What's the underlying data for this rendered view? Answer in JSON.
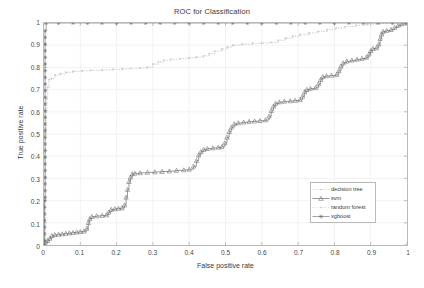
{
  "chart_data": {
    "type": "line",
    "title": "ROC for Classification",
    "xlabel": "False positive rate",
    "ylabel": "True positive rate",
    "xlim": [
      0,
      1
    ],
    "ylim": [
      0,
      1
    ],
    "xticks": [
      "0",
      "0.1",
      "0.2",
      "0.3",
      "0.4",
      "0.5",
      "0.6",
      "0.7",
      "0.8",
      "0.9",
      "1"
    ],
    "yticks": [
      "0",
      "0.1",
      "0.2",
      "0.3",
      "0.4",
      "0.5",
      "0.6",
      "0.7",
      "0.8",
      "0.9",
      "1"
    ],
    "grid": true,
    "legend_position": "lower-right",
    "series": [
      {
        "name": "decision tree",
        "color": "#c8c8c8",
        "marker": "dot",
        "linestyle": "dotted",
        "points": [
          [
            0,
            0
          ],
          [
            0.004,
            0.52
          ],
          [
            0.006,
            0.6
          ],
          [
            0.008,
            0.66
          ],
          [
            0.01,
            0.71
          ],
          [
            0.014,
            0.745
          ],
          [
            0.02,
            0.75
          ],
          [
            0.03,
            0.765
          ],
          [
            0.045,
            0.772
          ],
          [
            0.06,
            0.778
          ],
          [
            0.08,
            0.782
          ],
          [
            0.105,
            0.785
          ],
          [
            0.13,
            0.787
          ],
          [
            0.16,
            0.789
          ],
          [
            0.19,
            0.791
          ],
          [
            0.215,
            0.793
          ],
          [
            0.24,
            0.795
          ],
          [
            0.265,
            0.797
          ],
          [
            0.285,
            0.8
          ],
          [
            0.3,
            0.815
          ],
          [
            0.315,
            0.825
          ],
          [
            0.33,
            0.832
          ],
          [
            0.35,
            0.836
          ],
          [
            0.375,
            0.84
          ],
          [
            0.4,
            0.843
          ],
          [
            0.42,
            0.846
          ],
          [
            0.44,
            0.852
          ],
          [
            0.455,
            0.862
          ],
          [
            0.47,
            0.872
          ],
          [
            0.49,
            0.882
          ],
          [
            0.505,
            0.892
          ],
          [
            0.52,
            0.9
          ],
          [
            0.545,
            0.905
          ],
          [
            0.575,
            0.908
          ],
          [
            0.6,
            0.91
          ],
          [
            0.625,
            0.913
          ],
          [
            0.645,
            0.922
          ],
          [
            0.665,
            0.932
          ],
          [
            0.685,
            0.94
          ],
          [
            0.705,
            0.948
          ],
          [
            0.73,
            0.955
          ],
          [
            0.755,
            0.962
          ],
          [
            0.78,
            0.97
          ],
          [
            0.805,
            0.977
          ],
          [
            0.83,
            0.984
          ],
          [
            0.86,
            0.99
          ],
          [
            0.89,
            0.995
          ],
          [
            0.925,
            0.998
          ],
          [
            0.96,
            1.0
          ],
          [
            1,
            1
          ]
        ]
      },
      {
        "name": "svm",
        "color": "#666666",
        "marker": "triangle",
        "linestyle": "solid",
        "points": [
          [
            0,
            0
          ],
          [
            0.004,
            0.012
          ],
          [
            0.01,
            0.02
          ],
          [
            0.016,
            0.03
          ],
          [
            0.022,
            0.042
          ],
          [
            0.03,
            0.046
          ],
          [
            0.04,
            0.048
          ],
          [
            0.05,
            0.05
          ],
          [
            0.06,
            0.052
          ],
          [
            0.07,
            0.054
          ],
          [
            0.08,
            0.056
          ],
          [
            0.09,
            0.058
          ],
          [
            0.1,
            0.06
          ],
          [
            0.11,
            0.062
          ],
          [
            0.118,
            0.075
          ],
          [
            0.122,
            0.1
          ],
          [
            0.126,
            0.118
          ],
          [
            0.132,
            0.128
          ],
          [
            0.145,
            0.131
          ],
          [
            0.16,
            0.133
          ],
          [
            0.172,
            0.135
          ],
          [
            0.178,
            0.148
          ],
          [
            0.185,
            0.16
          ],
          [
            0.195,
            0.163
          ],
          [
            0.205,
            0.165
          ],
          [
            0.215,
            0.167
          ],
          [
            0.222,
            0.18
          ],
          [
            0.226,
            0.215
          ],
          [
            0.23,
            0.25
          ],
          [
            0.234,
            0.285
          ],
          [
            0.238,
            0.305
          ],
          [
            0.243,
            0.32
          ],
          [
            0.25,
            0.323
          ],
          [
            0.265,
            0.325
          ],
          [
            0.285,
            0.327
          ],
          [
            0.305,
            0.329
          ],
          [
            0.325,
            0.331
          ],
          [
            0.345,
            0.333
          ],
          [
            0.365,
            0.336
          ],
          [
            0.385,
            0.338
          ],
          [
            0.4,
            0.341
          ],
          [
            0.412,
            0.355
          ],
          [
            0.42,
            0.38
          ],
          [
            0.426,
            0.405
          ],
          [
            0.432,
            0.42
          ],
          [
            0.44,
            0.43
          ],
          [
            0.45,
            0.434
          ],
          [
            0.465,
            0.437
          ],
          [
            0.48,
            0.44
          ],
          [
            0.49,
            0.443
          ],
          [
            0.498,
            0.46
          ],
          [
            0.504,
            0.485
          ],
          [
            0.51,
            0.51
          ],
          [
            0.516,
            0.53
          ],
          [
            0.524,
            0.545
          ],
          [
            0.535,
            0.55
          ],
          [
            0.55,
            0.553
          ],
          [
            0.565,
            0.556
          ],
          [
            0.58,
            0.558
          ],
          [
            0.595,
            0.56
          ],
          [
            0.61,
            0.563
          ],
          [
            0.62,
            0.58
          ],
          [
            0.626,
            0.605
          ],
          [
            0.632,
            0.625
          ],
          [
            0.638,
            0.638
          ],
          [
            0.648,
            0.644
          ],
          [
            0.662,
            0.647
          ],
          [
            0.678,
            0.649
          ],
          [
            0.692,
            0.651
          ],
          [
            0.705,
            0.654
          ],
          [
            0.712,
            0.67
          ],
          [
            0.718,
            0.69
          ],
          [
            0.724,
            0.7
          ],
          [
            0.734,
            0.705
          ],
          [
            0.748,
            0.708
          ],
          [
            0.756,
            0.725
          ],
          [
            0.762,
            0.745
          ],
          [
            0.768,
            0.758
          ],
          [
            0.778,
            0.762
          ],
          [
            0.792,
            0.764
          ],
          [
            0.806,
            0.767
          ],
          [
            0.812,
            0.785
          ],
          [
            0.818,
            0.805
          ],
          [
            0.824,
            0.82
          ],
          [
            0.834,
            0.828
          ],
          [
            0.848,
            0.832
          ],
          [
            0.862,
            0.836
          ],
          [
            0.876,
            0.84
          ],
          [
            0.888,
            0.845
          ],
          [
            0.895,
            0.86
          ],
          [
            0.9,
            0.875
          ],
          [
            0.906,
            0.885
          ],
          [
            0.916,
            0.888
          ],
          [
            0.922,
            0.905
          ],
          [
            0.926,
            0.93
          ],
          [
            0.93,
            0.95
          ],
          [
            0.934,
            0.962
          ],
          [
            0.944,
            0.966
          ],
          [
            0.956,
            0.97
          ],
          [
            0.966,
            0.98
          ],
          [
            0.976,
            0.99
          ],
          [
            0.986,
            0.996
          ],
          [
            1,
            1
          ]
        ]
      },
      {
        "name": "random forest",
        "color": "#d0d0d0",
        "marker": "dot",
        "linestyle": "dotted",
        "points": [
          [
            0,
            0
          ],
          [
            0.004,
            0.52
          ],
          [
            0.006,
            0.6
          ],
          [
            0.008,
            0.66
          ],
          [
            0.01,
            0.71
          ],
          [
            0.014,
            0.745
          ],
          [
            0.02,
            0.75
          ],
          [
            0.03,
            0.765
          ],
          [
            0.045,
            0.772
          ],
          [
            0.06,
            0.778
          ],
          [
            0.08,
            0.782
          ],
          [
            0.105,
            0.785
          ],
          [
            0.13,
            0.787
          ],
          [
            0.16,
            0.789
          ],
          [
            0.19,
            0.791
          ],
          [
            0.215,
            0.793
          ],
          [
            0.24,
            0.795
          ],
          [
            0.265,
            0.797
          ],
          [
            0.285,
            0.8
          ],
          [
            0.3,
            0.815
          ],
          [
            0.315,
            0.825
          ],
          [
            0.33,
            0.832
          ],
          [
            0.35,
            0.836
          ],
          [
            0.375,
            0.84
          ],
          [
            0.4,
            0.843
          ],
          [
            0.42,
            0.846
          ],
          [
            0.44,
            0.852
          ],
          [
            0.455,
            0.862
          ],
          [
            0.47,
            0.872
          ],
          [
            0.49,
            0.882
          ],
          [
            0.505,
            0.892
          ],
          [
            0.52,
            0.9
          ],
          [
            0.545,
            0.905
          ],
          [
            0.575,
            0.908
          ],
          [
            0.6,
            0.91
          ],
          [
            0.625,
            0.913
          ],
          [
            0.645,
            0.922
          ],
          [
            0.665,
            0.932
          ],
          [
            0.685,
            0.94
          ],
          [
            0.705,
            0.948
          ],
          [
            0.73,
            0.955
          ],
          [
            0.755,
            0.962
          ],
          [
            0.78,
            0.97
          ],
          [
            0.805,
            0.977
          ],
          [
            0.83,
            0.984
          ],
          [
            0.86,
            0.99
          ],
          [
            0.89,
            0.995
          ],
          [
            0.925,
            0.998
          ],
          [
            0.96,
            1.0
          ],
          [
            1,
            1
          ]
        ]
      },
      {
        "name": "xgboost",
        "color": "#707070",
        "marker": "asterisk",
        "linestyle": "solid",
        "points": [
          [
            0,
            0
          ],
          [
            0.0015,
            0.02
          ],
          [
            0.0015,
            0.05
          ],
          [
            0.0015,
            0.08
          ],
          [
            0.0015,
            0.11
          ],
          [
            0.0015,
            0.14
          ],
          [
            0.0015,
            0.17
          ],
          [
            0.0015,
            0.2
          ],
          [
            0.003,
            0.215
          ],
          [
            0.003,
            0.245
          ],
          [
            0.003,
            0.275
          ],
          [
            0.003,
            0.305
          ],
          [
            0.003,
            0.335
          ],
          [
            0.003,
            0.365
          ],
          [
            0.003,
            0.395
          ],
          [
            0.003,
            0.425
          ],
          [
            0.003,
            0.455
          ],
          [
            0.003,
            0.485
          ],
          [
            0.003,
            0.515
          ],
          [
            0.003,
            0.545
          ],
          [
            0.003,
            0.575
          ],
          [
            0.003,
            0.605
          ],
          [
            0.003,
            0.635
          ],
          [
            0.003,
            0.665
          ],
          [
            0.003,
            0.695
          ],
          [
            0.003,
            0.725
          ],
          [
            0.003,
            0.755
          ],
          [
            0.003,
            0.785
          ],
          [
            0.003,
            0.815
          ],
          [
            0.003,
            0.845
          ],
          [
            0.003,
            0.875
          ],
          [
            0.003,
            0.905
          ],
          [
            0.003,
            0.935
          ],
          [
            0.003,
            0.965
          ],
          [
            0.006,
            1.0
          ],
          [
            0.04,
            1.0
          ],
          [
            0.08,
            1.0
          ],
          [
            0.12,
            1.0
          ],
          [
            0.16,
            1.0
          ],
          [
            0.2,
            1.0
          ],
          [
            0.24,
            1.0
          ],
          [
            0.28,
            1.0
          ],
          [
            0.32,
            1.0
          ],
          [
            0.36,
            1.0
          ],
          [
            0.4,
            1.0
          ],
          [
            0.44,
            1.0
          ],
          [
            0.48,
            1.0
          ],
          [
            0.52,
            1.0
          ],
          [
            0.56,
            1.0
          ],
          [
            0.6,
            1.0
          ],
          [
            0.64,
            1.0
          ],
          [
            0.68,
            1.0
          ],
          [
            0.72,
            1.0
          ],
          [
            0.76,
            1.0
          ],
          [
            0.8,
            1.0
          ],
          [
            0.84,
            1.0
          ],
          [
            0.88,
            1.0
          ],
          [
            0.92,
            1.0
          ],
          [
            0.96,
            1.0
          ],
          [
            1.0,
            1.0
          ]
        ]
      }
    ]
  },
  "legend": {
    "entries": [
      {
        "label": "decision tree"
      },
      {
        "label": "svm"
      },
      {
        "label": "random forest"
      },
      {
        "label": "xgboost"
      }
    ]
  }
}
